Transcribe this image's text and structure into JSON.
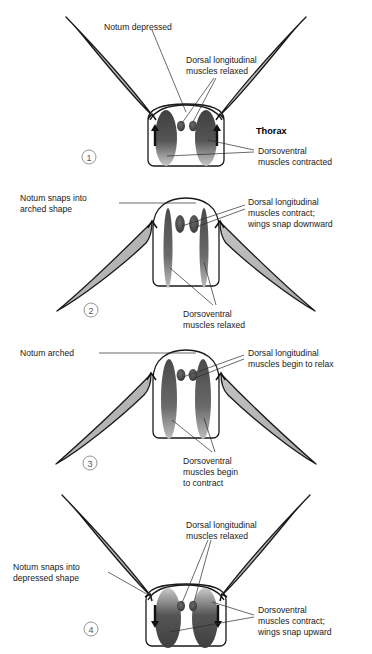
{
  "figure": {
    "panel_count": 4,
    "colors": {
      "wing_fill": "#b8b8b8",
      "wing_stroke": "#1a1a1a",
      "thorax_stroke": "#1a1a1a",
      "muscle_dark": "#4a4a4a",
      "muscle_mid": "#6e6e6e",
      "muscle_light": "#9a9a9a",
      "text": "#1a1a1a",
      "leader": "#2b2b2b",
      "background": "#ffffff"
    }
  },
  "panels": [
    {
      "number": "1",
      "number_glyph": "①",
      "wing_state": "raised",
      "notum_state": "depressed",
      "labels": {
        "notum": "Notum depressed",
        "dorsal_longitudinal_line1": "Dorsal longitudinal",
        "dorsal_longitudinal_line2": "muscles relaxed",
        "thorax": "Thorax",
        "dorsoventral_line1": "Dorsoventral",
        "dorsoventral_line2": "muscles contracted"
      }
    },
    {
      "number": "2",
      "number_glyph": "②",
      "wing_state": "lowered",
      "notum_state": "arched",
      "labels": {
        "notum_line1": "Notum snaps into",
        "notum_line2": "arched shape",
        "dorsal_longitudinal_line1": "Dorsal longitudinal",
        "dorsal_longitudinal_line2": "muscles contract;",
        "dorsal_longitudinal_line3": "wings snap downward",
        "dorsoventral_line1": "Dorsoventral",
        "dorsoventral_line2": "muscles relaxed"
      }
    },
    {
      "number": "3",
      "number_glyph": "③",
      "wing_state": "lowered",
      "notum_state": "arched",
      "labels": {
        "notum": "Notum arched",
        "dorsal_longitudinal_line1": "Dorsal longitudinal",
        "dorsal_longitudinal_line2": "muscles begin to relax",
        "dorsoventral_line1": "Dorsoventral",
        "dorsoventral_line2": "muscles begin",
        "dorsoventral_line3": "to contract"
      }
    },
    {
      "number": "4",
      "number_glyph": "④",
      "wing_state": "raised",
      "notum_state": "depressed",
      "labels": {
        "notum_line1": "Notum snaps into",
        "notum_line2": "depressed shape",
        "dorsal_longitudinal_line1": "Dorsal longitudinal",
        "dorsal_longitudinal_line2": "muscles relaxed",
        "dorsoventral_line1": "Dorsoventral",
        "dorsoventral_line2": "muscles contract;",
        "dorsoventral_line3": "wings snap upward"
      }
    }
  ]
}
